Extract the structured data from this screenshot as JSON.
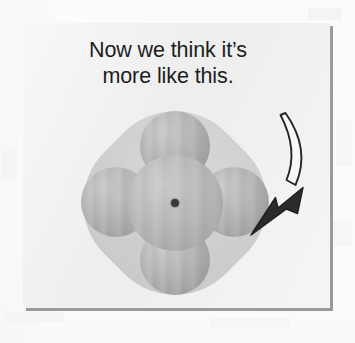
{
  "figure": {
    "caption": {
      "line1": "Now we think it’s",
      "line2": "more like this."
    },
    "arrow": {
      "name": "curved-arrow",
      "direction": "down-left",
      "style": "white-filled curved tapered arrow with dark outline",
      "outline_color": "#262626",
      "fill_color": "#f7f7f7"
    },
    "molecule": {
      "name": "space-filling-molecular-model",
      "description": "central sphere with four lobes at top, bottom, left and right inside a translucent rounded-diamond electron-cloud envelope",
      "lobe_labels": [
        "top",
        "right",
        "bottom",
        "left"
      ],
      "nucleus_dot": "•",
      "envelope_color": "#c9c9c9",
      "sphere_color": "#ababab",
      "nucleus_color": "#3a3a3a"
    },
    "panel": {
      "background_color": "#efefef",
      "shadow_color": "#9a9a9a"
    },
    "page": {
      "background_color": "#fbfbfb"
    }
  }
}
